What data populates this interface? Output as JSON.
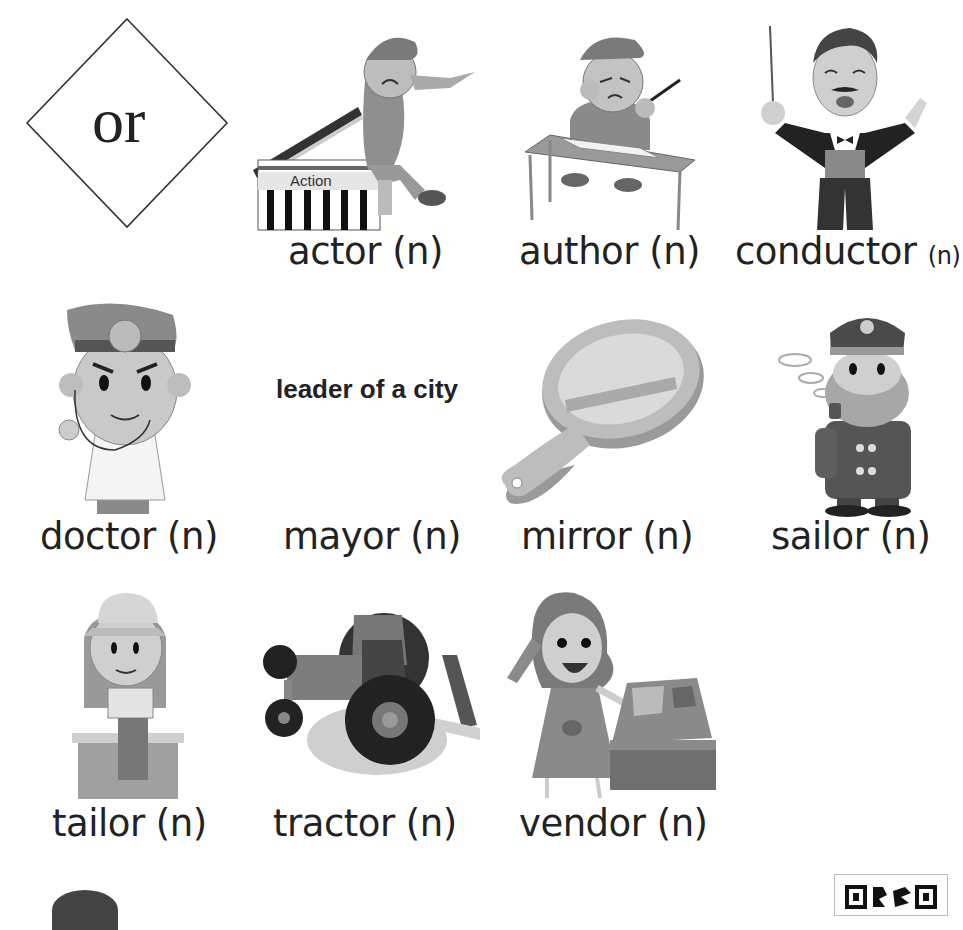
{
  "header": {
    "connector_word": "or"
  },
  "vocab_cards": [
    {
      "word": "actor",
      "pos": "(n)",
      "illustration": "actor-on-clapperboard-icon",
      "prop_text": "Action"
    },
    {
      "word": "author",
      "pos": "(n)",
      "illustration": "author-writing-at-desk-icon"
    },
    {
      "word": "conductor",
      "pos": "(n)",
      "illustration": "conductor-with-baton-icon"
    },
    {
      "word": "doctor",
      "pos": "(n)",
      "illustration": "doctor-with-stethoscope-icon"
    },
    {
      "word": "mayor",
      "pos": "(n)",
      "definition": "leader of a city"
    },
    {
      "word": "mirror",
      "pos": "(n)",
      "illustration": "hand-mirror-icon"
    },
    {
      "word": "sailor",
      "pos": "(n)",
      "illustration": "sailor-with-pipe-icon"
    },
    {
      "word": "tailor",
      "pos": "(n)",
      "illustration": "tailor-with-sewing-machine-icon"
    },
    {
      "word": "tractor",
      "pos": "(n)",
      "illustration": "tractor-icon"
    },
    {
      "word": "vendor",
      "pos": "(n)",
      "illustration": "vendor-at-market-stall-icon"
    }
  ],
  "colors": {
    "ink": "#222222",
    "dark_gray": "#4a4a4a",
    "mid_gray": "#8a8a8a",
    "light_gray": "#c4c4c4",
    "background": "#ffffff"
  }
}
